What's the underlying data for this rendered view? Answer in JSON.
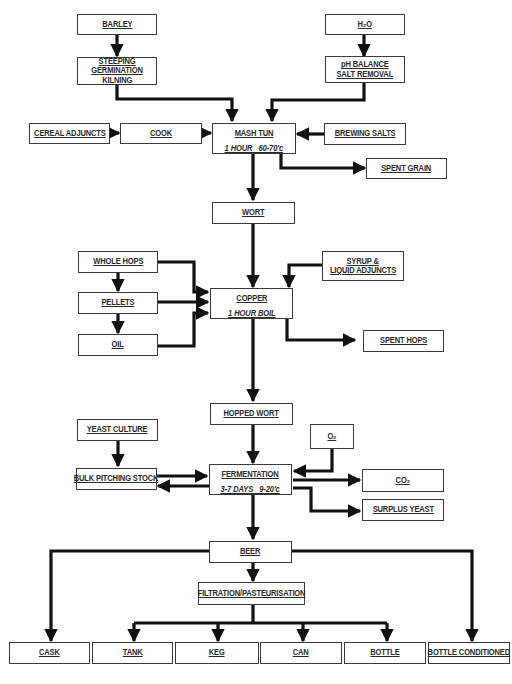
{
  "diagram": {
    "type": "flowchart",
    "colors": {
      "line": "#111111",
      "box_border": "#3a3a3a",
      "text": "#2a2a2a",
      "background": "#ffffff"
    },
    "nodes": {
      "barley": {
        "label": "BARLEY"
      },
      "steeping": {
        "lines": [
          "STEEPING",
          "GERMINATION",
          "KILNING"
        ]
      },
      "water": {
        "label": "H₂O"
      },
      "ph_balance": {
        "lines": [
          "pH BALANCE",
          "SALT REMOVAL"
        ]
      },
      "cereal_adjuncts": {
        "label": "CEREAL ADJUNCTS"
      },
      "cook": {
        "label": "COOK"
      },
      "mash_tun": {
        "label": "MASH TUN",
        "detail": "1 HOUR   60-70'c"
      },
      "brewing_salts": {
        "label": "BREWING SALTS"
      },
      "spent_grain": {
        "label": "SPENT GRAIN"
      },
      "wort": {
        "label": "WORT"
      },
      "whole_hops": {
        "label": "WHOLE HOPS"
      },
      "pellets": {
        "label": "PELLETS"
      },
      "oil": {
        "label": "OIL"
      },
      "syrup": {
        "lines": [
          "SYRUP &",
          "LIQUID ADJUNCTS"
        ]
      },
      "copper": {
        "label": "COPPER",
        "detail": "1 HOUR BOIL"
      },
      "spent_hops": {
        "label": "SPENT HOPS"
      },
      "hopped_wort": {
        "label": "HOPPED WORT"
      },
      "yeast_culture": {
        "label": "YEAST CULTURE"
      },
      "oxygen": {
        "label": "O₂"
      },
      "bulk_pitching_stock": {
        "label": "BULK PITCHING STOCK"
      },
      "fermentation": {
        "label": "FERMENTATION",
        "detail": "3-7 DAYS   9-20'c"
      },
      "co2": {
        "label": "CO₂"
      },
      "surplus_yeast": {
        "label": "SURPLUS YEAST"
      },
      "beer": {
        "label": "BEER"
      },
      "filtration": {
        "label": "FILTRATION/PASTEURISATION"
      },
      "cask": {
        "label": "CASK"
      },
      "tank": {
        "label": "TANK"
      },
      "keg": {
        "label": "KEG"
      },
      "can": {
        "label": "CAN"
      },
      "bottle": {
        "label": "BOTTLE"
      },
      "bottle_conditioned": {
        "label": "BOTTLE  CONDITIONED"
      }
    },
    "edges": [
      [
        "BARLEY",
        "STEEPING/GERMINATION/KILNING"
      ],
      [
        "STEEPING/GERMINATION/KILNING",
        "MASH TUN"
      ],
      [
        "H2O",
        "pH BALANCE/SALT REMOVAL"
      ],
      [
        "pH BALANCE/SALT REMOVAL",
        "MASH TUN"
      ],
      [
        "CEREAL ADJUNCTS",
        "COOK"
      ],
      [
        "COOK",
        "MASH TUN"
      ],
      [
        "BREWING SALTS",
        "MASH TUN"
      ],
      [
        "MASH TUN",
        "SPENT GRAIN"
      ],
      [
        "MASH TUN",
        "WORT"
      ],
      [
        "WORT",
        "COPPER"
      ],
      [
        "WHOLE HOPS",
        "PELLETS"
      ],
      [
        "PELLETS",
        "OIL"
      ],
      [
        "WHOLE HOPS",
        "COPPER"
      ],
      [
        "PELLETS",
        "COPPER"
      ],
      [
        "OIL",
        "COPPER"
      ],
      [
        "SYRUP & LIQUID ADJUNCTS",
        "COPPER"
      ],
      [
        "COPPER",
        "SPENT HOPS"
      ],
      [
        "COPPER",
        "HOPPED WORT"
      ],
      [
        "HOPPED WORT",
        "FERMENTATION"
      ],
      [
        "YEAST CULTURE",
        "BULK PITCHING STOCK"
      ],
      [
        "BULK PITCHING STOCK",
        "FERMENTATION"
      ],
      [
        "FERMENTATION",
        "BULK PITCHING STOCK"
      ],
      [
        "O2",
        "FERMENTATION"
      ],
      [
        "FERMENTATION",
        "CO2"
      ],
      [
        "FERMENTATION",
        "SURPLUS YEAST"
      ],
      [
        "FERMENTATION",
        "BEER"
      ],
      [
        "BEER",
        "CASK"
      ],
      [
        "BEER",
        "FILTRATION/PASTEURISATION"
      ],
      [
        "BEER",
        "BOTTLE CONDITIONED"
      ],
      [
        "FILTRATION/PASTEURISATION",
        "TANK"
      ],
      [
        "FILTRATION/PASTEURISATION",
        "KEG"
      ],
      [
        "FILTRATION/PASTEURISATION",
        "CAN"
      ],
      [
        "FILTRATION/PASTEURISATION",
        "BOTTLE"
      ]
    ]
  }
}
